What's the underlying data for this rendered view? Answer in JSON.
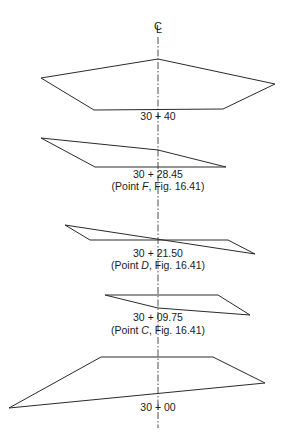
{
  "diagram": {
    "centerline": {
      "symbol": "CL",
      "x": 158,
      "y_start": 37,
      "y_end": 428
    },
    "sections": [
      {
        "station": "30 + 40",
        "reference": null,
        "points": "41,78 158,59 275,84 223,109 94,110",
        "label_y": 120
      },
      {
        "station": "30 + 28.45",
        "reference": {
          "prefix": "(Point ",
          "point": "F",
          "suffix": ", Fig. 16.41)"
        },
        "points": "41,138 158,150 226,167 95,167",
        "label_y": 178,
        "ref_y": 190
      },
      {
        "station": "30 + 21.50",
        "reference": {
          "prefix": "(Point ",
          "point": "D",
          "suffix": ", Fig. 16.41)"
        },
        "points": "65,225 255,254 228,240 90,240",
        "label_y": 257,
        "ref_y": 269
      },
      {
        "station": "30 + 09.75",
        "reference": {
          "prefix": "(Point ",
          "point": "C",
          "suffix": ", Fig. 16.41)"
        },
        "points": "105,295 218,295 250,315 158,308",
        "label_y": 321,
        "ref_y": 334
      },
      {
        "station": "30 + 00",
        "reference": null,
        "points": "101,357 213,357 265,383 9,408",
        "label_y": 411
      }
    ],
    "colors": {
      "stroke": "#2a2a2a",
      "text": "#1a1a1a",
      "background": "#ffffff"
    }
  }
}
